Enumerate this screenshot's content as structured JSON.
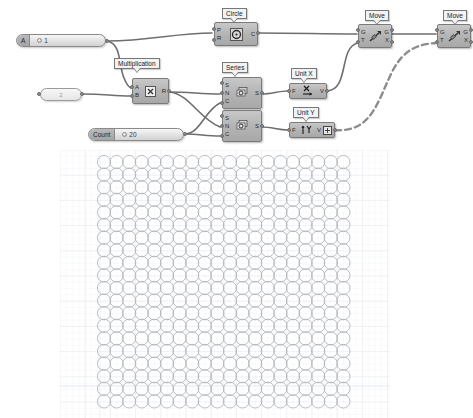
{
  "app": {
    "title": "Grasshopper Canvas",
    "canvas_background": "#ffffff",
    "wire_color": "#6e6e6e",
    "node_fill": "#b4b4b4",
    "node_border": "#7a7a7a",
    "circle_stroke": "#b0b4b8"
  },
  "sliders": [
    {
      "id": "slider-a",
      "label": "A",
      "value": "1",
      "knob_icon": "slider-knob-icon"
    },
    {
      "id": "slider-count",
      "label": "Count",
      "value": "20",
      "knob_icon": "slider-knob-icon"
    }
  ],
  "panels": [
    {
      "id": "panel-two",
      "value": "2"
    }
  ],
  "components": [
    {
      "id": "circle",
      "name": "Circle",
      "bubble": "Circle",
      "icon": "circle-component-icon",
      "inputs": [
        "P",
        "R"
      ],
      "outputs": [
        "C"
      ]
    },
    {
      "id": "multiplication",
      "name": "Multiplication",
      "bubble": "Multiplication",
      "icon": "multiply-icon",
      "icon_glyph": "×",
      "inputs": [
        "A",
        "B"
      ],
      "outputs": [
        "R"
      ]
    },
    {
      "id": "series-1",
      "name": "Series",
      "bubble": "Series",
      "icon": "series-icon",
      "inputs": [
        "S",
        "N",
        "C"
      ],
      "outputs": [
        "S"
      ]
    },
    {
      "id": "series-2",
      "name": "Series",
      "bubble": "",
      "icon": "series-icon",
      "inputs": [
        "S",
        "N",
        "C"
      ],
      "outputs": [
        "S"
      ]
    },
    {
      "id": "unit-x",
      "name": "Unit X",
      "bubble": "Unit X",
      "icon": "unit-x-icon",
      "inputs": [
        "F"
      ],
      "outputs": [
        "V"
      ]
    },
    {
      "id": "unit-y",
      "name": "Unit Y",
      "bubble": "Unit Y",
      "icon": "unit-y-icon",
      "inputs": [
        "F"
      ],
      "outputs": [
        "V"
      ]
    },
    {
      "id": "move-1",
      "name": "Move",
      "bubble": "Move",
      "icon": "move-icon",
      "inputs": [
        "G",
        "T"
      ],
      "outputs": [
        "G",
        "X"
      ]
    },
    {
      "id": "move-2",
      "name": "Move",
      "bubble": "Move",
      "icon": "move-icon",
      "inputs": [
        "G",
        "T"
      ],
      "outputs": [
        "G",
        "X"
      ]
    }
  ],
  "viewport": {
    "name": "circle-grid-preview",
    "columns": 20,
    "rows": 20,
    "spacing_px": 12.6,
    "circle_radius_px": 6.6,
    "grid_visible": true
  }
}
